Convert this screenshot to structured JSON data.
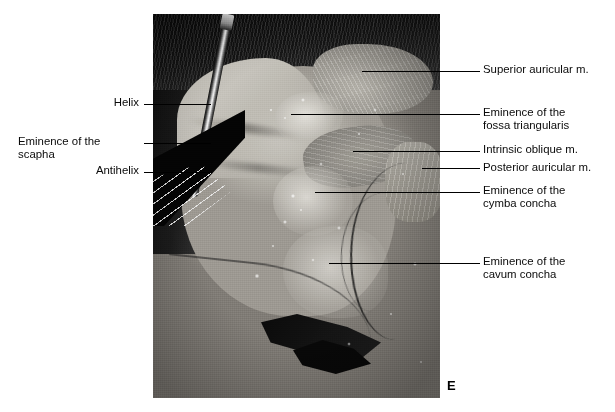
{
  "figure": {
    "panel_letter": "E",
    "photo": {
      "alt_description": "Grayscale cadaveric dissection photograph of the posterior (medial) surface of the right auricle with overlying skin reflected, showing auricular muscles and cartilaginous eminences; a forceps and retractor hold the skin flap at lower left."
    },
    "labels_left": [
      {
        "id": "helix",
        "text": "Helix",
        "text_x": 77,
        "text_y": 96,
        "text_width": 62,
        "leader_x": 144,
        "leader_y": 104,
        "leader_length": 67
      },
      {
        "id": "eminence-of-the-scapha",
        "text": "Eminence of the\nscapha",
        "text_x": 18,
        "text_y": 135,
        "text_width": 121,
        "leader_x": 144,
        "leader_y": 143,
        "leader_length": 67
      },
      {
        "id": "antihelix",
        "text": "Antihelix",
        "text_x": 60,
        "text_y": 164,
        "text_width": 79,
        "leader_x": 144,
        "leader_y": 172,
        "leader_length": 67
      }
    ],
    "labels_right": [
      {
        "id": "superior-auricular-m",
        "text": "Superior auricular m.",
        "text_x": 483,
        "text_y": 63,
        "leader_x": 362,
        "leader_y": 71,
        "leader_length": 118
      },
      {
        "id": "eminence-of-the-fossa-triangularis",
        "text": "Eminence of the\nfossa triangularis",
        "text_x": 483,
        "text_y": 106,
        "leader_x": 291,
        "leader_y": 114,
        "leader_length": 189
      },
      {
        "id": "intrinsic-oblique-m",
        "text": "Intrinsic oblique m.",
        "text_x": 483,
        "text_y": 143,
        "leader_x": 353,
        "leader_y": 151,
        "leader_length": 127
      },
      {
        "id": "posterior-auricular-m",
        "text": "Posterior auricular m.",
        "text_x": 483,
        "text_y": 161,
        "leader_x": 422,
        "leader_y": 168,
        "leader_length": 58
      },
      {
        "id": "eminence-of-the-cymba-concha",
        "text": "Eminence of the\ncymba concha",
        "text_x": 483,
        "text_y": 184,
        "leader_x": 315,
        "leader_y": 192,
        "leader_length": 165
      },
      {
        "id": "eminence-of-the-cavum-concha",
        "text": "Eminence of the\ncavum concha",
        "text_x": 483,
        "text_y": 255,
        "leader_x": 329,
        "leader_y": 263,
        "leader_length": 151
      }
    ]
  }
}
